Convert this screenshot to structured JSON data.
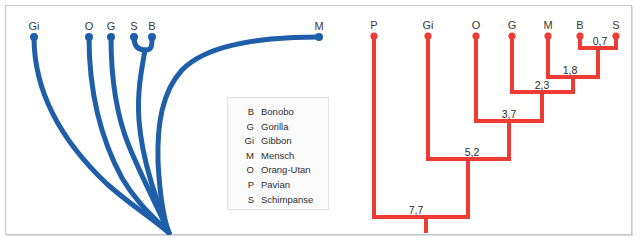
{
  "figure": {
    "title": "",
    "accent_blue": "#1f5ea8",
    "accent_red": "#ee3b33",
    "frame_color": "#c8c8c8"
  },
  "legend": {
    "entries": [
      {
        "abbr": "B",
        "name": "Bonobo"
      },
      {
        "abbr": "G",
        "name": "Gorilla"
      },
      {
        "abbr": "Gi",
        "name": "Gibbon"
      },
      {
        "abbr": "M",
        "name": "Mensch"
      },
      {
        "abbr": "O",
        "name": "Orang-Utan"
      },
      {
        "abbr": "P",
        "name": "Pavian"
      },
      {
        "abbr": "S",
        "name": "Schimpanse"
      }
    ]
  },
  "left_tree": {
    "kind": "curved-phylogram",
    "color": "#1f5ea8",
    "tips": [
      {
        "label": "Gi",
        "x": 28,
        "y": 31
      },
      {
        "label": "O",
        "x": 83,
        "y": 31
      },
      {
        "label": "G",
        "x": 105,
        "y": 31
      },
      {
        "label": "S",
        "x": 128,
        "y": 31
      },
      {
        "label": "B",
        "x": 146,
        "y": 31
      },
      {
        "label": "M",
        "x": 313,
        "y": 31
      }
    ]
  },
  "right_tree": {
    "kind": "rectangular-cladogram",
    "color": "#ee3b33",
    "scale_unit": "Millionen Jahre",
    "tips": [
      {
        "label": "P",
        "x": 368,
        "y": 30
      },
      {
        "label": "Gi",
        "x": 422,
        "y": 30
      },
      {
        "label": "O",
        "x": 470,
        "y": 30
      },
      {
        "label": "G",
        "x": 506,
        "y": 30
      },
      {
        "label": "M",
        "x": 542,
        "y": 30
      },
      {
        "label": "B",
        "x": 574,
        "y": 30
      },
      {
        "label": "S",
        "x": 610,
        "y": 30
      }
    ],
    "nodes": [
      {
        "label": "0,7",
        "value": 0.7,
        "children": [
          "B",
          "S"
        ],
        "y": 42,
        "label_x": 598,
        "label_y": 36
      },
      {
        "label": "1,8",
        "value": 1.8,
        "children": [
          "M",
          "0,7"
        ],
        "y": 71,
        "label_x": 565,
        "label_y": 65
      },
      {
        "label": "2,3",
        "value": 2.3,
        "children": [
          "G",
          "1,8"
        ],
        "y": 86,
        "label_x": 538,
        "label_y": 80
      },
      {
        "label": "3,7",
        "value": 3.7,
        "children": [
          "O",
          "2,3"
        ],
        "y": 115,
        "label_x": 504,
        "label_y": 109
      },
      {
        "label": "5,2",
        "value": 5.2,
        "children": [
          "Gi",
          "3,7"
        ],
        "y": 153,
        "label_x": 468,
        "label_y": 147
      },
      {
        "label": "7,7",
        "value": 7.7,
        "children": [
          "P",
          "5,2"
        ],
        "y": 211,
        "label_x": 410,
        "label_y": 205
      }
    ],
    "root": {
      "x": 420,
      "y_top": 211,
      "y_bottom": 227
    }
  }
}
